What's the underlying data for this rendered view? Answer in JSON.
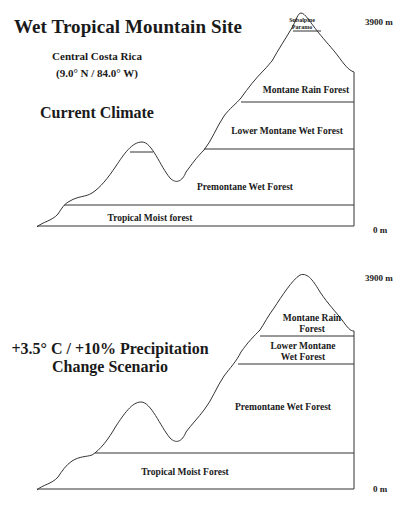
{
  "title": "Wet Tropical Mountain Site",
  "location": {
    "name": "Central Costa Rica",
    "coords": "(9.0° N / 84.0° W)"
  },
  "panels": [
    {
      "heading": "Current Climate",
      "top_elevation": "3900 m",
      "base_elevation": "0 m",
      "zones": [
        {
          "label": "Subalpine Paramo",
          "line1": "Subalpine",
          "line2": "Paramo"
        },
        {
          "label": "Montane Rain Forest"
        },
        {
          "label": "Lower Montane Wet Forest"
        },
        {
          "label": "Premontane Wet Forest"
        },
        {
          "label": "Tropical Moist forest"
        }
      ]
    },
    {
      "heading_line1": "+3.5° C / +10% Precipitation",
      "heading_line2": "Change Scenario",
      "top_elevation": "3900 m",
      "base_elevation": "0 m",
      "zones": [
        {
          "label": "Montane Rain Forest",
          "line1": "Montane Rain",
          "line2": "Forest"
        },
        {
          "label": "Lower Montane Wet Forest",
          "line1": "Lower Montane",
          "line2": "Wet Forest"
        },
        {
          "label": "Premontane Wet Forest"
        },
        {
          "label": "Tropical Moist Forest"
        }
      ]
    }
  ]
}
